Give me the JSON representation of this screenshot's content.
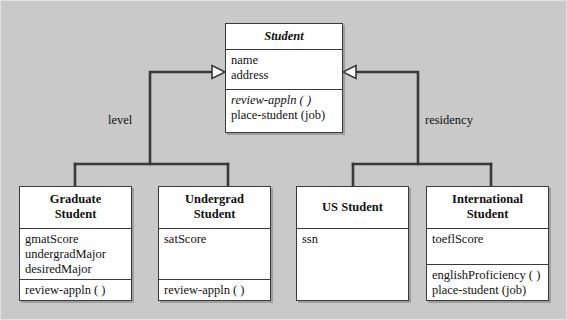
{
  "diagram": {
    "background_color": "#c9c9c9",
    "box_fill": "#ffffff",
    "line_color": "#3a3a3a"
  },
  "superclass": {
    "name": "Student",
    "abstract": true,
    "attributes": [
      "name",
      "address"
    ],
    "operations": [
      {
        "label": "review-appln ( )",
        "abstract": true
      },
      {
        "label": "place-student (job)",
        "abstract": false
      }
    ]
  },
  "discriminators": [
    {
      "id": "level",
      "label": "level"
    },
    {
      "id": "residency",
      "label": "residency"
    }
  ],
  "subclasses": [
    {
      "id": "graduate-student",
      "name_line1": "Graduate",
      "name_line2": "Student",
      "attributes": [
        "gmatScore",
        "undergradMajor",
        "desiredMajor"
      ],
      "operations": [
        {
          "label": "review-appln ( )",
          "abstract": false
        }
      ]
    },
    {
      "id": "undergrad-student",
      "name_line1": "Undergrad",
      "name_line2": "Student",
      "attributes": [
        "satScore"
      ],
      "operations": [
        {
          "label": "review-appln ( )",
          "abstract": false
        }
      ]
    },
    {
      "id": "us-student",
      "name_line1": "US Student",
      "name_line2": "",
      "attributes": [
        "ssn"
      ],
      "operations": []
    },
    {
      "id": "international-student",
      "name_line1": "International",
      "name_line2": "Student",
      "attributes": [
        "toeflScore"
      ],
      "operations": [
        {
          "label": "englishProficiency ( )",
          "abstract": false
        },
        {
          "label": "place-student (job)",
          "abstract": false
        }
      ]
    }
  ]
}
